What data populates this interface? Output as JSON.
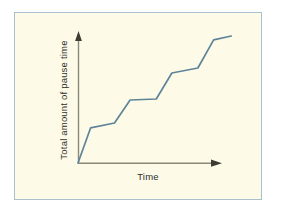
{
  "figure": {
    "background_color": "#ffffff",
    "plate_color": "#fdfbe8",
    "border_color": "#a8c0cd",
    "axis_color": "#8a8a78",
    "line_color": "#5e8499"
  },
  "chart_data": {
    "type": "line",
    "title": "",
    "xlabel": "Time",
    "ylabel": "Total amount of pause time",
    "grid": false,
    "legend": null,
    "annotations": [],
    "axis_arrows": {
      "x": "arrow-right",
      "y": "arrow-up"
    },
    "xticklabels": [],
    "yticklabels": [],
    "xlim": [
      0,
      10
    ],
    "ylim": [
      0,
      10
    ],
    "series": [
      {
        "name": "Total amount of pause time",
        "x": [
          0.0,
          0.86,
          2.5,
          3.57,
          5.36,
          6.43,
          8.21,
          9.29,
          10.5
        ],
        "y": [
          0.0,
          2.76,
          3.15,
          4.96,
          5.04,
          7.09,
          7.48,
          9.69,
          10.0
        ]
      }
    ]
  }
}
